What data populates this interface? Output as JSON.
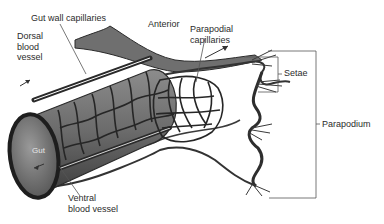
{
  "figure": {
    "labels": {
      "gut_wall_capillaries": "Gut wall capillaries",
      "anterior": "Anterior",
      "dorsal_blood_vessel": [
        "Dorsal",
        "blood",
        "vessel"
      ],
      "parapodial_capillaries": [
        "Parapodial",
        "capillaries"
      ],
      "setae": "Setae",
      "parapodium": "Parapodium",
      "gut": "Gut",
      "ventral_blood_vessel": [
        "Ventral",
        "blood vessel"
      ]
    },
    "colors": {
      "gut_fill": "#6e6e6e",
      "gut_face": "#8a8a8a",
      "outline": "#2a2a2a",
      "vessel": "#3a3a3a",
      "leader_line": "#555555",
      "label_text": "#2b2b2b"
    }
  }
}
